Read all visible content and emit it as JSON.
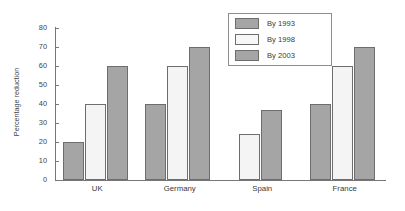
{
  "chart_data": {
    "type": "bar",
    "title": "",
    "subtitle": "",
    "xlabel": "",
    "ylabel": "Percentage reduction",
    "categories": [
      "UK",
      "Germany",
      "Spain",
      "France"
    ],
    "series": [
      {
        "name": "By 1993",
        "color": "#a5a5a5",
        "values": [
          20,
          40,
          null,
          40
        ]
      },
      {
        "name": "By 1998",
        "color": "#f4f4f4",
        "values": [
          40,
          60,
          24,
          60
        ]
      },
      {
        "name": "By 2003",
        "color": "#a5a5a5",
        "values": [
          60,
          70,
          37,
          70
        ]
      }
    ],
    "ylim": [
      0,
      80
    ],
    "ytick_labels": [
      "0",
      "10",
      "20",
      "30",
      "40",
      "50",
      "60",
      "70",
      "80"
    ],
    "ytick_values": [
      0,
      10,
      20,
      30,
      40,
      50,
      60,
      70,
      80
    ],
    "grid": false,
    "legend_position": "top-right",
    "legend_entries": [
      "By 1993",
      "By 1998",
      "By 2003"
    ]
  }
}
